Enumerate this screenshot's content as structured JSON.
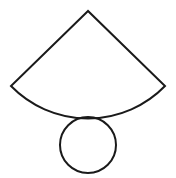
{
  "diagram": {
    "stroke_color": "#1a1a1a",
    "background": "#ffffff",
    "stroke_width": 2,
    "sector": {
      "apex": [
        88,
        11
      ],
      "left": [
        11,
        86
      ],
      "right": [
        165,
        86
      ],
      "radius": 107.5
    },
    "circle": {
      "cx": 88,
      "cy": 145,
      "r": 28
    }
  }
}
